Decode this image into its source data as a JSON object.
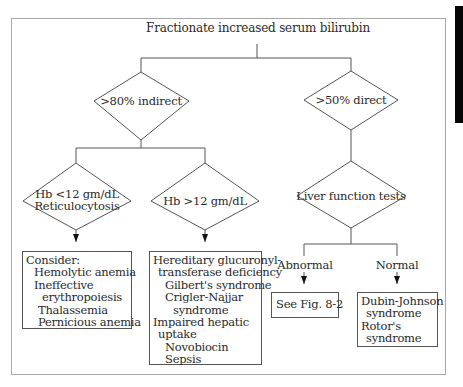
{
  "title": "Fractionate increased serum bilirubin",
  "decisions": {
    "indirect": ">80% indirect",
    "direct": ">50% direct",
    "hb_low": [
      "Hb <12 gm/dL",
      "Reticulocytosis"
    ],
    "hb_high": "Hb >12 gm/dL",
    "lft": "Liver function tests"
  },
  "branch_labels": {
    "abnormal": "Abnormal",
    "normal": "Normal"
  },
  "outcomes": {
    "consider": [
      {
        "text": "Consider:",
        "indent": 0
      },
      {
        "text": "Hemolytic anemia",
        "indent": 1
      },
      {
        "text": "Ineffective",
        "indent": 1
      },
      {
        "text": "erythropoiesis",
        "indent": 2
      },
      {
        "text": "Thalassemia",
        "indent": 1.5
      },
      {
        "text": "Pernicious anemia",
        "indent": 1.5
      }
    ],
    "hereditary": [
      {
        "text": "Hereditary glucuronyl-",
        "indent": 0
      },
      {
        "text": "transferase deficiency",
        "indent": 1
      },
      {
        "text": "Gilbert's syndrome",
        "indent": 1.5
      },
      {
        "text": "Crigler-Najjar",
        "indent": 1.5
      },
      {
        "text": "syndrome",
        "indent": 2
      },
      {
        "text": "Impaired hepatic",
        "indent": 0
      },
      {
        "text": "uptake",
        "indent": 1
      },
      {
        "text": "Novobiocin",
        "indent": 1.5
      },
      {
        "text": "Sepsis",
        "indent": 1.5
      }
    ],
    "see_fig": "See Fig. 8-2",
    "dubin": [
      {
        "text": "Dubin-Johnson",
        "indent": 0
      },
      {
        "text": "syndrome",
        "indent": 1
      },
      {
        "text": "Rotor's",
        "indent": 0
      },
      {
        "text": "syndrome",
        "indent": 1
      }
    ]
  },
  "colors": {
    "line": "#555555",
    "frame": "#a8a8a8",
    "tab": "#050505"
  }
}
